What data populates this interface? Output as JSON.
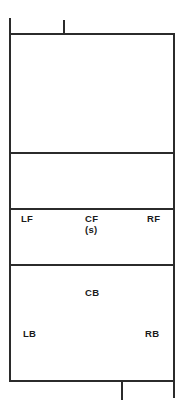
{
  "diagram": {
    "type": "court-position-diagram",
    "line_color": "#2b2b2b",
    "background_color": "#ffffff",
    "text_color": "#1a1a1a"
  },
  "court": {
    "zones": [
      {
        "name": "back-zone-top",
        "label": ""
      },
      {
        "name": "middle-zone",
        "label": ""
      },
      {
        "name": "front-row-zone",
        "label": ""
      },
      {
        "name": "back-row-zone",
        "label": ""
      }
    ]
  },
  "positions": {
    "left_front": {
      "label": "LF",
      "note": ""
    },
    "center_front": {
      "label": "CF",
      "note": "(s)"
    },
    "right_front": {
      "label": "RF",
      "note": ""
    },
    "center_back": {
      "label": "CB",
      "note": ""
    },
    "left_back": {
      "label": "LB",
      "note": ""
    },
    "right_back": {
      "label": "RB",
      "note": ""
    }
  },
  "markers": {
    "top_left_post": "post-tick",
    "top_center_post": "post-tick",
    "bottom_center_post": "post-tick",
    "bottom_right_post": "post-tick"
  }
}
